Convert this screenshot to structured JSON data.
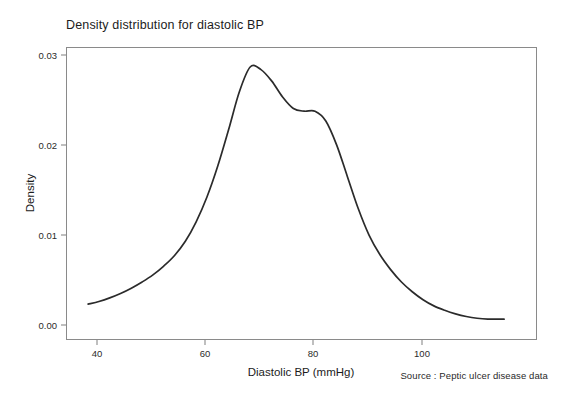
{
  "figure": {
    "title": "Density distribution for diastolic BP",
    "source_note": "Source : Peptic ulcer disease data",
    "background_color": "#ffffff",
    "frame_color": "#8a8a8a",
    "curve_color": "#2b2b2b"
  },
  "chart_data": {
    "type": "line",
    "title": "Density distribution for diastolic BP",
    "subtitle": "",
    "xlabel": "Diastolic BP (mmHg)",
    "ylabel": "Density",
    "xlim": [
      34,
      121
    ],
    "ylim": [
      -0.0015,
      0.0315
    ],
    "xticks": [
      40,
      60,
      80,
      100
    ],
    "xtick_labels": [
      "40",
      "60",
      "80",
      "100"
    ],
    "yticks": [
      0.0,
      0.01,
      0.02,
      0.03
    ],
    "ytick_labels": [
      "0.00",
      "0.01",
      "0.02",
      "0.03"
    ],
    "grid": false,
    "legend": false,
    "legend_position": "none",
    "annotations": [
      "Source : Peptic ulcer disease data"
    ],
    "series": [
      {
        "name": "Kernel density of diastolic BP",
        "x": [
          38,
          40,
          42,
          44,
          46,
          48,
          50,
          52,
          54,
          56,
          58,
          60,
          62,
          64,
          66,
          68,
          70,
          72,
          74,
          76,
          78,
          80,
          82,
          84,
          86,
          88,
          90,
          92,
          94,
          96,
          98,
          100,
          102,
          104,
          106,
          108,
          110,
          112,
          114,
          115
        ],
        "values": [
          0.0025,
          0.0028,
          0.0032,
          0.0037,
          0.0043,
          0.005,
          0.0058,
          0.0068,
          0.008,
          0.0096,
          0.0118,
          0.0146,
          0.0181,
          0.0222,
          0.0265,
          0.0293,
          0.029,
          0.0277,
          0.0259,
          0.0246,
          0.0243,
          0.0243,
          0.0232,
          0.0205,
          0.0169,
          0.0133,
          0.0103,
          0.0081,
          0.0064,
          0.005,
          0.0039,
          0.003,
          0.0023,
          0.0018,
          0.0014,
          0.0011,
          0.0009,
          0.0008,
          0.0008,
          0.0008
        ]
      }
    ],
    "peaks": [
      {
        "label": "main mode",
        "x": 68,
        "y": 0.0295
      },
      {
        "label": "shoulder mode",
        "x": 79,
        "y": 0.0243
      }
    ]
  }
}
